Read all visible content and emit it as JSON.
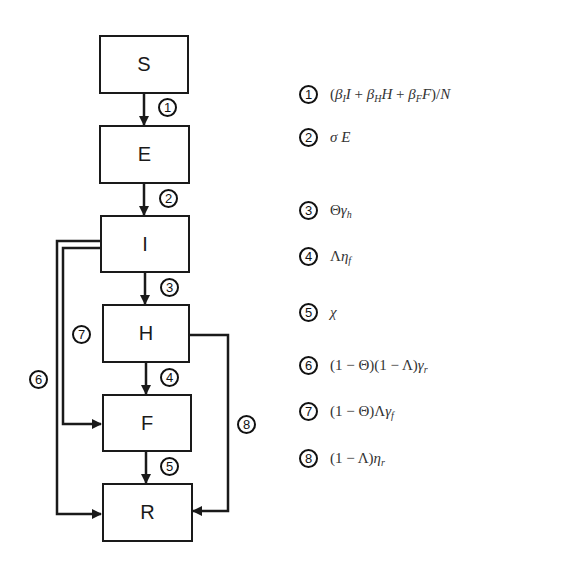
{
  "diagram": {
    "compartments": [
      {
        "id": "S",
        "label": "S"
      },
      {
        "id": "E",
        "label": "E"
      },
      {
        "id": "I",
        "label": "I"
      },
      {
        "id": "H",
        "label": "H"
      },
      {
        "id": "F",
        "label": "F"
      },
      {
        "id": "R",
        "label": "R"
      }
    ],
    "transitions": [
      {
        "num": "1",
        "from": "S",
        "to": "E"
      },
      {
        "num": "2",
        "from": "E",
        "to": "I"
      },
      {
        "num": "3",
        "from": "I",
        "to": "H"
      },
      {
        "num": "4",
        "from": "H",
        "to": "F"
      },
      {
        "num": "5",
        "from": "F",
        "to": "R"
      },
      {
        "num": "6",
        "from": "I",
        "to": "R"
      },
      {
        "num": "7",
        "from": "I",
        "to": "F"
      },
      {
        "num": "8",
        "from": "H",
        "to": "R"
      }
    ],
    "colors": {
      "line": "#1a1a1a",
      "text": "#333333",
      "background": "#ffffff"
    }
  },
  "legend": [
    {
      "num": "1",
      "expr": "(β_I I + β_H H + β_F F)/N"
    },
    {
      "num": "2",
      "expr": "σ E"
    },
    {
      "num": "3",
      "expr": "Θγ_h"
    },
    {
      "num": "4",
      "expr": "Λη_f"
    },
    {
      "num": "5",
      "expr": "χ"
    },
    {
      "num": "6",
      "expr": "(1 − Θ)(1 − Λ)γ_r"
    },
    {
      "num": "7",
      "expr": "(1 − Θ)Λγ_f"
    },
    {
      "num": "8",
      "expr": "(1 − Λ)η_r"
    }
  ]
}
